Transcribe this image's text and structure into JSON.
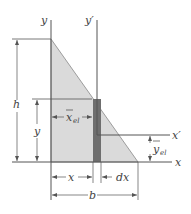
{
  "figure": {
    "colors": {
      "triangle_fill": "#d9d9d9",
      "strip_fill": "#6e6e6e",
      "line": "#555555",
      "text": "#444444"
    },
    "labels": {
      "y_axis": "y",
      "y_prime_axis": "y′",
      "x_axis": "x",
      "x_prime_axis": "x′",
      "height": "h",
      "strip_height": "y",
      "x_el_bar": "x",
      "x_el_sub": "el",
      "y_el_bar": "y",
      "y_el_sub": "el",
      "x_dim": "x",
      "dx_dim": "dx",
      "base": "b"
    }
  }
}
